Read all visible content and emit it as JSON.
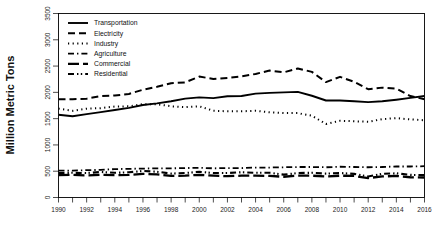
{
  "chart_data": {
    "type": "line",
    "title": "",
    "xlabel": "",
    "ylabel": "Million Metric Tons",
    "xlim": [
      1990,
      2016
    ],
    "ylim": [
      0,
      3500
    ],
    "yticks": [
      0,
      500,
      1000,
      1500,
      2000,
      2500,
      3000,
      3500
    ],
    "xticks": [
      1990,
      1992,
      1994,
      1996,
      1998,
      2000,
      2002,
      2004,
      2006,
      2008,
      2010,
      2012,
      2014,
      2016
    ],
    "xtick_minor": [
      1991,
      1993,
      1995,
      1997,
      1999,
      2001,
      2003,
      2005,
      2007,
      2009,
      2011,
      2013,
      2015
    ],
    "grid": false,
    "legend_position": "top-left",
    "x": [
      1990,
      1991,
      1992,
      1993,
      1994,
      1995,
      1996,
      1997,
      1998,
      1999,
      2000,
      2001,
      2002,
      2003,
      2004,
      2005,
      2006,
      2007,
      2008,
      2009,
      2010,
      2011,
      2012,
      2013,
      2014,
      2015,
      2016
    ],
    "series": [
      {
        "name": "Transportation",
        "style": "solid",
        "values": [
          1575,
          1545,
          1585,
          1625,
          1665,
          1705,
          1760,
          1790,
          1830,
          1880,
          1905,
          1890,
          1925,
          1930,
          1975,
          1990,
          2000,
          2010,
          1935,
          1845,
          1845,
          1830,
          1815,
          1830,
          1860,
          1895,
          1930
        ]
      },
      {
        "name": "Electricity",
        "style": "dashed",
        "values": [
          1870,
          1870,
          1880,
          1930,
          1940,
          1970,
          2050,
          2105,
          2175,
          2190,
          2300,
          2255,
          2275,
          2305,
          2350,
          2415,
          2380,
          2455,
          2390,
          2195,
          2295,
          2200,
          2060,
          2090,
          2070,
          1930,
          1870
        ]
      },
      {
        "name": "Industry",
        "style": "dotted",
        "values": [
          1690,
          1650,
          1690,
          1700,
          1730,
          1735,
          1775,
          1775,
          1735,
          1720,
          1735,
          1650,
          1640,
          1640,
          1650,
          1620,
          1605,
          1605,
          1555,
          1400,
          1460,
          1450,
          1440,
          1490,
          1510,
          1485,
          1470
        ]
      },
      {
        "name": "Agriculture",
        "style": "dashdot",
        "values": [
          512,
          512,
          520,
          525,
          540,
          545,
          550,
          555,
          555,
          560,
          565,
          555,
          560,
          560,
          570,
          570,
          575,
          580,
          580,
          575,
          585,
          580,
          575,
          580,
          590,
          590,
          595
        ]
      },
      {
        "name": "Commercial",
        "style": "longdash",
        "values": [
          425,
          430,
          420,
          430,
          425,
          430,
          450,
          440,
          410,
          415,
          430,
          415,
          405,
          415,
          415,
          410,
          395,
          415,
          415,
          400,
          415,
          410,
          370,
          400,
          410,
          385,
          380
        ]
      },
      {
        "name": "Residential",
        "style": "dashdotdot",
        "values": [
          465,
          470,
          465,
          485,
          470,
          480,
          505,
          490,
          455,
          465,
          490,
          465,
          465,
          480,
          470,
          470,
          435,
          465,
          470,
          455,
          465,
          450,
          400,
          450,
          460,
          430,
          425
        ]
      }
    ]
  },
  "legend": {
    "items": [
      {
        "label": "Transportation",
        "style": "solid"
      },
      {
        "label": "Electricity",
        "style": "dashed"
      },
      {
        "label": "Industry",
        "style": "dotted"
      },
      {
        "label": "Agriculture",
        "style": "dashdot"
      },
      {
        "label": "Commercial",
        "style": "longdash"
      },
      {
        "label": "Residential",
        "style": "dashdotdot"
      }
    ]
  },
  "colors": {
    "line": "#000000",
    "frame": "#000000",
    "background": "#ffffff",
    "text": "#111111"
  }
}
